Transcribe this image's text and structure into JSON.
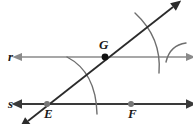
{
  "figure": {
    "type": "geometry-construction-diagram",
    "title": "",
    "background_color": "#ffffff",
    "width": 193,
    "height": 124
  },
  "colors": {
    "line_r": "#8a8a8a",
    "line_s": "#3a3a3a",
    "transversal": "#2b2b2b",
    "arc": "#6e6e6e",
    "point_G_fill": "#111111",
    "point_E_fill": "#777777",
    "point_F_fill": "#777777",
    "label_text": "#1a1a1a"
  },
  "lines": [
    {
      "id": "line-r",
      "label": "r",
      "label_x": 8,
      "label_y": 61,
      "y": 57,
      "x1": 22,
      "x2": 186,
      "arrow_left": true,
      "arrow_right": true,
      "stroke": "#8a8a8a",
      "stroke_width": 1.5
    },
    {
      "id": "line-s",
      "label": "s",
      "label_x": 8,
      "label_y": 108,
      "y": 104,
      "x1": 22,
      "x2": 186,
      "arrow_left": true,
      "arrow_right": true,
      "stroke": "#3a3a3a",
      "stroke_width": 1.8
    },
    {
      "id": "transversal",
      "label": "",
      "x1": 28,
      "y1": 121,
      "x2": 173,
      "y2": 7,
      "arrow_left": true,
      "arrow_right": true,
      "stroke": "#2b2b2b",
      "stroke_width": 1.8
    }
  ],
  "points": [
    {
      "id": "point-G",
      "label": "G",
      "x": 105,
      "y": 57,
      "radius": 3.4,
      "fill": "#111111",
      "label_x": 99,
      "label_y": 49,
      "on_lines": [
        "line-r",
        "transversal"
      ]
    },
    {
      "id": "point-E",
      "label": "E",
      "x": 47,
      "y": 104,
      "radius": 3.0,
      "fill": "#777777",
      "label_x": 44,
      "label_y": 118,
      "on_lines": [
        "line-s",
        "transversal"
      ]
    },
    {
      "id": "point-F",
      "label": "F",
      "x": 131,
      "y": 104,
      "radius": 3.0,
      "fill": "#777777",
      "label_x": 128,
      "label_y": 118,
      "on_lines": [
        "line-s"
      ]
    }
  ],
  "arcs": [
    {
      "id": "arc-at-E",
      "description": "compass arc centered at E crossing the transversal and line s",
      "path": "M 67 57 Q 96 72 97 114",
      "stroke": "#6e6e6e",
      "stroke_width": 1.4
    },
    {
      "id": "arc-at-G-large",
      "description": "compass arc centered at G crossing the transversal and line r",
      "path": "M 135 13 Q 162 38 159 73",
      "stroke": "#6e6e6e",
      "stroke_width": 1.4
    },
    {
      "id": "arc-at-G-small",
      "description": "short compass arc to the right of G marking the intersection",
      "path": "M 186 43 Q 170 45 166 62",
      "stroke": "#6e6e6e",
      "stroke_width": 1.4
    }
  ],
  "label_font_size": 13
}
